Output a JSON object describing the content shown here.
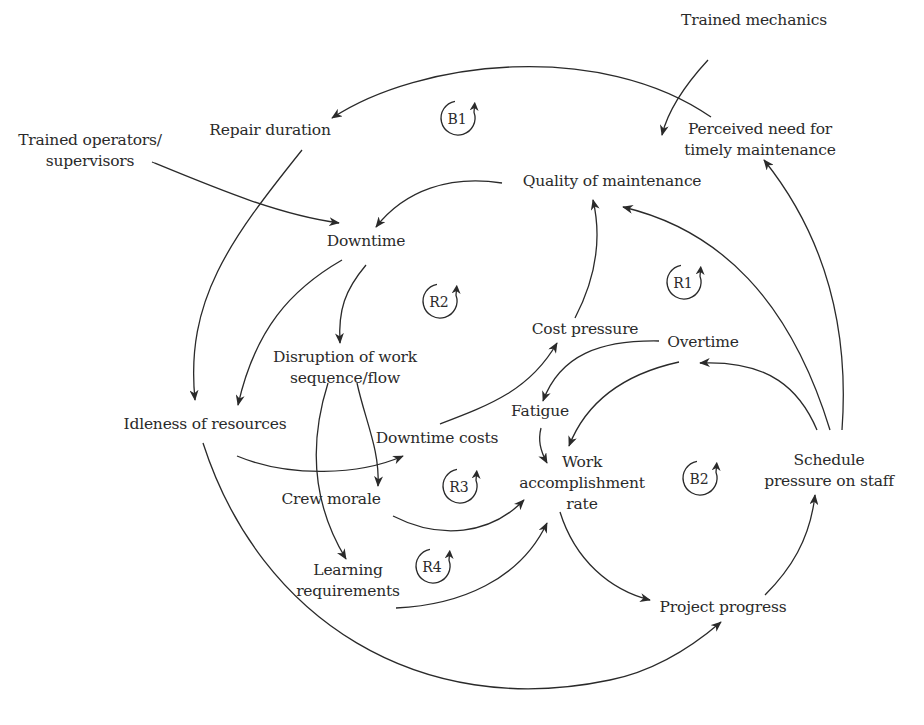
{
  "diagram": {
    "type": "causal-loop-diagram",
    "nodes": [
      {
        "id": "trained_mechanics",
        "label": "Trained mechanics",
        "x": 754,
        "y": 10
      },
      {
        "id": "repair_duration",
        "label": "Repair duration",
        "x": 270,
        "y": 120
      },
      {
        "id": "perceived_need",
        "label": "Perceived need for\ntimely maintenance",
        "x": 760,
        "y": 119
      },
      {
        "id": "trained_operators",
        "label": "Trained operators/\nsupervisors",
        "x": 90,
        "y": 130
      },
      {
        "id": "quality_maintenance",
        "label": "Quality of maintenance",
        "x": 612,
        "y": 171
      },
      {
        "id": "downtime",
        "label": "Downtime",
        "x": 366,
        "y": 231
      },
      {
        "id": "disruption",
        "label": "Disruption of work\nsequence/flow",
        "x": 345,
        "y": 347
      },
      {
        "id": "cost_pressure",
        "label": "Cost pressure",
        "x": 585,
        "y": 319
      },
      {
        "id": "overtime",
        "label": "Overtime",
        "x": 703,
        "y": 332
      },
      {
        "id": "fatigue",
        "label": "Fatigue",
        "x": 540,
        "y": 401
      },
      {
        "id": "idleness",
        "label": "Idleness of resources",
        "x": 205,
        "y": 414
      },
      {
        "id": "downtime_costs",
        "label": "Downtime costs",
        "x": 437,
        "y": 428
      },
      {
        "id": "work_rate",
        "label": "Work\naccomplishment\nrate",
        "x": 582,
        "y": 452
      },
      {
        "id": "schedule_pressure",
        "label": "Schedule\npressure on staff",
        "x": 829,
        "y": 450
      },
      {
        "id": "crew_morale",
        "label": "Crew morale",
        "x": 331,
        "y": 489
      },
      {
        "id": "learning_requirements",
        "label": "Learning\nrequirements",
        "x": 348,
        "y": 560
      },
      {
        "id": "project_progress",
        "label": "Project progress",
        "x": 723,
        "y": 597
      }
    ],
    "loops": [
      {
        "id": "B1",
        "label": "B1",
        "x": 458,
        "y": 118,
        "type": "balancing"
      },
      {
        "id": "R2",
        "label": "R2",
        "x": 440,
        "y": 301,
        "type": "reinforcing"
      },
      {
        "id": "R1",
        "label": "R1",
        "x": 684,
        "y": 282,
        "type": "reinforcing"
      },
      {
        "id": "R3",
        "label": "R3",
        "x": 460,
        "y": 486,
        "type": "reinforcing"
      },
      {
        "id": "B2",
        "label": "B2",
        "x": 700,
        "y": 478,
        "type": "balancing"
      },
      {
        "id": "R4",
        "label": "R4",
        "x": 433,
        "y": 566,
        "type": "reinforcing"
      }
    ],
    "edges": [
      {
        "from": "perceived_need",
        "to": "repair_duration",
        "path": "M 711 117 C 600 40, 420 60, 332 118"
      },
      {
        "from": "trained_mechanics",
        "to": "perceived_need",
        "path": "M 708 60 C 685 85, 668 110, 662 135"
      },
      {
        "from": "trained_operators",
        "to": "downtime",
        "path": "M 152 162 C 220 190, 280 215, 339 223"
      },
      {
        "from": "repair_duration",
        "to": "idleness",
        "path": "M 302 150 C 230 240, 185 300, 195 400"
      },
      {
        "from": "quality_maintenance",
        "to": "downtime",
        "path": "M 502 183 C 450 175, 405 190, 376 227"
      },
      {
        "from": "downtime",
        "to": "idleness",
        "path": "M 342 260 C 290 290, 255 330, 238 405"
      },
      {
        "from": "downtime",
        "to": "disruption",
        "path": "M 366 265 C 345 290, 338 310, 340 343"
      },
      {
        "from": "cost_pressure",
        "to": "quality_maintenance",
        "path": "M 575 318 C 600 270, 600 230, 593 200"
      },
      {
        "from": "schedule_pressure",
        "to": "quality_maintenance",
        "path": "M 830 430 C 790 300, 720 230, 623 207"
      },
      {
        "from": "schedule_pressure",
        "to": "perceived_need",
        "path": "M 842 430 C 850 320, 820 230, 764 160"
      },
      {
        "from": "schedule_pressure",
        "to": "overtime",
        "path": "M 817 430 C 800 390, 770 360, 700 363"
      },
      {
        "from": "overtime",
        "to": "fatigue",
        "path": "M 659 341 C 600 340, 560 355, 543 401"
      },
      {
        "from": "overtime",
        "to": "work_rate",
        "path": "M 679 362 C 620 375, 585 405, 569 446"
      },
      {
        "from": "downtime_costs",
        "to": "cost_pressure",
        "path": "M 440 424 C 490 405, 530 390, 557 343"
      },
      {
        "from": "fatigue",
        "to": "work_rate",
        "path": "M 541 428 C 538 440, 540 450, 547 463"
      },
      {
        "from": "idleness",
        "to": "downtime_costs",
        "path": "M 237 456 C 290 478, 360 475, 403 456"
      },
      {
        "from": "disruption",
        "to": "downtime_costs",
        "path": "M 357 383 C 365 420, 380 450, 378 486"
      },
      {
        "from": "disruption",
        "to": "learning_requirements",
        "path": "M 328 383 C 310 440, 310 500, 346 559"
      },
      {
        "from": "crew_morale",
        "to": "work_rate",
        "path": "M 393 516 C 440 540, 490 535, 524 500"
      },
      {
        "from": "learning_requirements",
        "to": "work_rate",
        "path": "M 396 608 C 460 605, 520 580, 547 523"
      },
      {
        "from": "work_rate",
        "to": "project_progress",
        "path": "M 560 512 C 575 560, 610 590, 650 600"
      },
      {
        "from": "project_progress",
        "to": "schedule_pressure",
        "path": "M 765 595 C 790 570, 810 540, 815 495"
      },
      {
        "from": "idleness",
        "to": "project_progress",
        "path": "M 203 443 C 260 620, 420 720, 610 680 C 660 670, 700 640, 721 622"
      }
    ]
  }
}
